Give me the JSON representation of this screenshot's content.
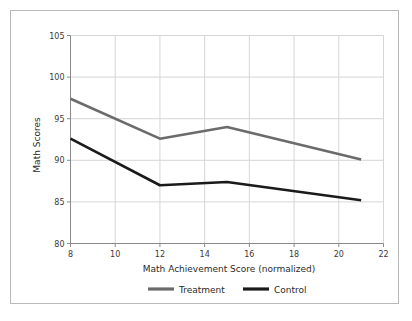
{
  "chart_data": {
    "type": "line",
    "title": "",
    "xlabel": "Math Achievement Score (normalized)",
    "ylabel": "Math Scores",
    "xlim": [
      8,
      22
    ],
    "ylim": [
      80,
      105
    ],
    "xticks": [
      8,
      10,
      12,
      14,
      16,
      18,
      20,
      22
    ],
    "xtick_labels": [
      "8",
      "10",
      "12",
      "14",
      "16",
      "18",
      "20",
      "22"
    ],
    "yticks": [
      80,
      85,
      90,
      95,
      100,
      105
    ],
    "ytick_labels": [
      "80",
      "85",
      "90",
      "95",
      "100",
      "105"
    ],
    "grid": true,
    "legend_position": "bottom",
    "x": [
      8,
      12,
      15,
      21
    ],
    "series": [
      {
        "name": "Treatment",
        "color": "#6b6b6b",
        "values": [
          97.4,
          92.6,
          94.0,
          90.1
        ]
      },
      {
        "name": "Control",
        "color": "#1a1a1a",
        "values": [
          92.6,
          87.0,
          87.4,
          85.2
        ]
      }
    ]
  },
  "legend": {
    "items": [
      {
        "label": "Treatment",
        "color": "#6b6b6b"
      },
      {
        "label": "Control",
        "color": "#1a1a1a"
      }
    ]
  },
  "colors": {
    "background": "#ffffff",
    "figure_border": "#b9b9b9",
    "axis": "#8a8a8a",
    "grid": "#d6d6d6",
    "text": "#2b2b2b",
    "treatment": "#6b6b6b",
    "control": "#1a1a1a"
  }
}
